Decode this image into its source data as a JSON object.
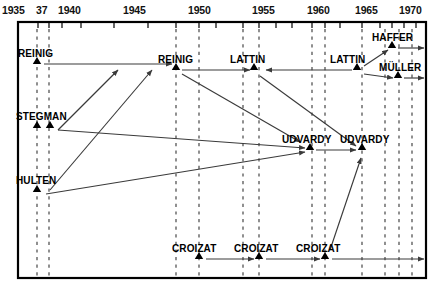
{
  "diagram": {
    "type": "timeline-flow",
    "frame": {
      "x": 18,
      "y": 22,
      "width": 408,
      "height": 256
    },
    "axis": {
      "orientation": "horizontal-top",
      "range": [
        1935,
        1972
      ],
      "labels": [
        {
          "text": "1935",
          "year": 1935,
          "x": 2
        },
        {
          "text": "37",
          "year": 1937,
          "x": 36
        },
        {
          "text": "1940",
          "year": 1940,
          "x": 58
        },
        {
          "text": "1945",
          "year": 1945,
          "x": 123
        },
        {
          "text": "1950",
          "year": 1950,
          "x": 188
        },
        {
          "text": "1955",
          "year": 1955,
          "x": 252
        },
        {
          "text": "1960",
          "year": 1960,
          "x": 307
        },
        {
          "text": "1965",
          "year": 1965,
          "x": 355
        },
        {
          "text": "1970",
          "year": 1970,
          "x": 399
        }
      ],
      "ticks": [
        18,
        38,
        49,
        62,
        81,
        114,
        148,
        176,
        199,
        216,
        243,
        259,
        276,
        292,
        312,
        325,
        340,
        362,
        380,
        392,
        404,
        416
      ]
    },
    "guides": [
      {
        "x": 37
      },
      {
        "x": 49
      },
      {
        "x": 176
      },
      {
        "x": 199
      },
      {
        "x": 243
      },
      {
        "x": 259
      },
      {
        "x": 312
      },
      {
        "x": 325
      },
      {
        "x": 362
      },
      {
        "x": 385
      },
      {
        "x": 399
      },
      {
        "x": 412
      }
    ],
    "nodes": [
      {
        "id": "reinig1",
        "label": "REINIG",
        "lx": 18,
        "ly": 48,
        "markers": [
          {
            "x": 37,
            "y": 64
          }
        ]
      },
      {
        "id": "reinig2",
        "label": "REINIG",
        "lx": 158,
        "ly": 54,
        "markers": [
          {
            "x": 176,
            "y": 70
          }
        ]
      },
      {
        "id": "lattin1",
        "label": "LATTIN",
        "lx": 230,
        "ly": 54,
        "markers": [
          {
            "x": 254,
            "y": 70
          }
        ]
      },
      {
        "id": "lattin2",
        "label": "LATTIN",
        "lx": 330,
        "ly": 54,
        "markers": [
          {
            "x": 357,
            "y": 70
          }
        ]
      },
      {
        "id": "haffer",
        "label": "HAFFER",
        "lx": 372,
        "ly": 32,
        "markers": [
          {
            "x": 392,
            "y": 48
          }
        ]
      },
      {
        "id": "muller",
        "label": "MÜLLER",
        "lx": 379,
        "ly": 62,
        "markers": [
          {
            "x": 398,
            "y": 78
          }
        ]
      },
      {
        "id": "stegman",
        "label": "STEGMAN",
        "lx": 16,
        "ly": 111,
        "markers": [
          {
            "x": 37,
            "y": 128
          },
          {
            "x": 50,
            "y": 128
          }
        ]
      },
      {
        "id": "udvardy1",
        "label": "UDVARDY",
        "lx": 282,
        "ly": 134,
        "markers": [
          {
            "x": 310,
            "y": 150
          }
        ]
      },
      {
        "id": "udvardy2",
        "label": "UDVARDY",
        "lx": 340,
        "ly": 134,
        "markers": [
          {
            "x": 362,
            "y": 150
          }
        ]
      },
      {
        "id": "hulten",
        "label": "HULTEN",
        "lx": 16,
        "ly": 175,
        "markers": [
          {
            "x": 37,
            "y": 192
          }
        ]
      },
      {
        "id": "croizat1",
        "label": "CROIZAT",
        "lx": 172,
        "ly": 243,
        "markers": [
          {
            "x": 199,
            "y": 259
          }
        ]
      },
      {
        "id": "croizat2",
        "label": "CROIZAT",
        "lx": 234,
        "ly": 243,
        "markers": [
          {
            "x": 259,
            "y": 259
          }
        ]
      },
      {
        "id": "croizat3",
        "label": "CROIZAT",
        "lx": 296,
        "ly": 243,
        "markers": [
          {
            "x": 325,
            "y": 259
          }
        ]
      }
    ],
    "arrows": [
      {
        "from": "reinig1",
        "to": "reinig2",
        "x1": 44,
        "y1": 64,
        "x2": 172,
        "y2": 64
      },
      {
        "from": "reinig2",
        "to": "lattin1",
        "x1": 182,
        "y1": 70,
        "x2": 250,
        "y2": 70
      },
      {
        "from": "lattin2",
        "to": "haffer",
        "x1": 364,
        "y1": 66,
        "x2": 388,
        "y2": 50
      },
      {
        "from": "lattin2",
        "to": "muller",
        "x1": 364,
        "y1": 74,
        "x2": 393,
        "y2": 78
      },
      {
        "from": "haffer",
        "to": "future",
        "x1": 398,
        "y1": 48,
        "x2": 424,
        "y2": 48
      },
      {
        "from": "muller",
        "to": "future",
        "x1": 404,
        "y1": 78,
        "x2": 424,
        "y2": 78
      },
      {
        "from": "lattin1",
        "to": "lattin2",
        "x1": 266,
        "y1": 70,
        "x2": 352,
        "y2": 70,
        "reverse": true
      },
      {
        "from": "stegman",
        "to": "reinig2",
        "x1": 58,
        "y1": 130,
        "x2": 118,
        "y2": 70
      },
      {
        "from": "hulten",
        "to": "reinig2",
        "x1": 50,
        "y1": 190,
        "x2": 152,
        "y2": 70
      },
      {
        "from": "stegman",
        "to": "udvardy1",
        "x1": 58,
        "y1": 130,
        "x2": 305,
        "y2": 148
      },
      {
        "from": "hulten",
        "to": "udvardy1",
        "x1": 46,
        "y1": 194,
        "x2": 305,
        "y2": 152
      },
      {
        "from": "reinig2",
        "to": "udvardy1",
        "x1": 182,
        "y1": 74,
        "x2": 300,
        "y2": 142
      },
      {
        "from": "lattin1",
        "to": "udvardy2",
        "x1": 260,
        "y1": 76,
        "x2": 356,
        "y2": 146
      },
      {
        "from": "udvardy1",
        "to": "udvardy2",
        "x1": 316,
        "y1": 150,
        "x2": 356,
        "y2": 150
      },
      {
        "from": "croizat3",
        "to": "udvardy2",
        "x1": 330,
        "y1": 250,
        "x2": 361,
        "y2": 158
      },
      {
        "from": "croizat1",
        "to": "croizat2",
        "x1": 206,
        "y1": 259,
        "x2": 254,
        "y2": 259
      },
      {
        "from": "croizat2",
        "to": "croizat3",
        "x1": 266,
        "y1": 259,
        "x2": 320,
        "y2": 259
      },
      {
        "from": "croizat3",
        "to": "future",
        "x1": 332,
        "y1": 259,
        "x2": 424,
        "y2": 259
      }
    ],
    "colors": {
      "line": "#3a3a3a",
      "frame": "#000000",
      "guide": "#555555",
      "text": "#000000"
    }
  }
}
